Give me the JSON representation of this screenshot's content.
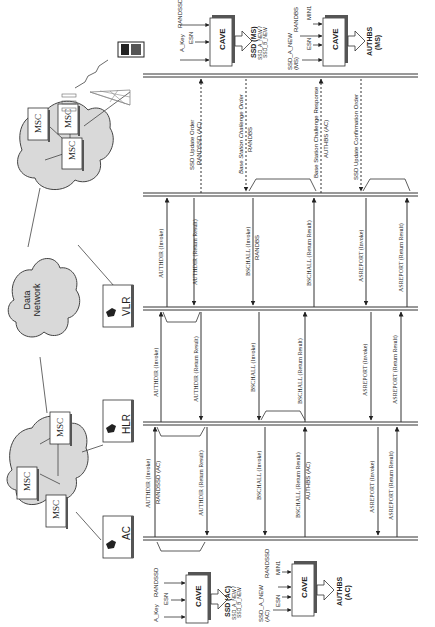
{
  "network": {
    "msc_label": "MSC",
    "data_network_label": [
      "Data",
      "Network"
    ],
    "vlr_label": "VLR",
    "hlr_label": "HLR",
    "ac_label": "AC"
  },
  "cave_blocks": {
    "ms_ssd": {
      "inputs": [
        "A_Key",
        "ESN",
        "RANDSSD"
      ],
      "label": "CAVE",
      "output_title": "SSD (MS)",
      "output_sub": [
        "SSD_A_NEW /",
        "SSD_B_NEW"
      ]
    },
    "ms_authbs": {
      "inputs": [
        "SSD_A_NEW",
        "(MS)",
        "ESN",
        "RANDBS",
        "MIN1"
      ],
      "label": "CAVE",
      "output_title": "AUTHBS",
      "output_sub": [
        "(MS)"
      ]
    },
    "ac_ssd": {
      "inputs": [
        "A_Key",
        "ESN",
        "RANDSSD"
      ],
      "label": "CAVE",
      "output_title": "SSD (AC)",
      "output_sub": [
        "SSD_A_NEW /",
        "SSD_B_NEW"
      ]
    },
    "ac_authbs": {
      "inputs": [
        "SSD_A_NEW",
        "(AC)",
        "ESN",
        "RANDSSD",
        "MIN1"
      ],
      "label": "CAVE",
      "output_title": "AUTHBS",
      "output_sub": [
        "(AC)"
      ]
    }
  },
  "messages": {
    "ms_msc": [
      {
        "line1": "SSD Update Order",
        "line2": "RANDSSD (AC)"
      },
      {
        "line1": "Base Station Challenge Order",
        "line2": "RANDBS"
      },
      {
        "line1": "Base Station Challenge Response",
        "line2": "AUTHBS (AC)"
      },
      {
        "line1": "SSD Update Confirmation Order",
        "line2": ""
      }
    ],
    "msc_vlr": [
      {
        "line1": "AUTHDIR (Invoke)",
        "line2": ""
      },
      {
        "line1": "AUTHDIR (Return Result)",
        "line2": ""
      },
      {
        "line1": "BSCHALL (Invoke)",
        "line2": "RANDBS"
      },
      {
        "line1": "BSCHALL (Return Result)",
        "line2": ""
      },
      {
        "line1": "ASREPORT (Invoke)",
        "line2": ""
      },
      {
        "line1": "ASREPORT (Return Result)",
        "line2": ""
      }
    ],
    "vlr_hlr": [
      {
        "line1": "AUTHDIR (Invoke)",
        "line2": ""
      },
      {
        "line1": "AUTHDIR (Return Result)",
        "line2": ""
      },
      {
        "line1": "BSCHALL (Invoke)",
        "line2": ""
      },
      {
        "line1": "BSCHALL (Return Result)",
        "line2": ""
      },
      {
        "line1": "ASREPORT (Invoke)",
        "line2": ""
      },
      {
        "line1": "ASREPORT (Return Result)",
        "line2": ""
      }
    ],
    "hlr_ac": [
      {
        "line1": "AUTHDIR (Invoke)",
        "line2": "RANDSSD (AC)"
      },
      {
        "line1": "AUTHDIR (Return Result)",
        "line2": ""
      },
      {
        "line1": "BSCHALL (Invoke)",
        "line2": ""
      },
      {
        "line1": "BSCHALL (Return Result)",
        "line2": "AUTHBS (AC)"
      },
      {
        "line1": "ASREPORT (Invoke)",
        "line2": ""
      },
      {
        "line1": "ASREPORT (Return Result)",
        "line2": ""
      }
    ]
  },
  "colors": {
    "line": "#333333",
    "cloud_fill": "#d9d9d9",
    "box_fill": "#ffffff",
    "box_shadow": "#555555",
    "tower": "#888888"
  }
}
